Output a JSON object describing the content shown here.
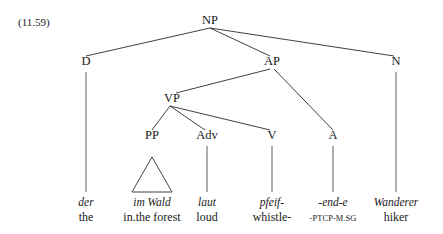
{
  "figure": {
    "example_number": "(11.59)",
    "language": "German",
    "type": "syntax-tree",
    "ink_color": "#1a1a1a",
    "line_color": "#2b2b2b",
    "background_color": "#ffffff"
  },
  "nodes": [
    {
      "id": "NP",
      "label": "NP",
      "x": 210,
      "y": 24,
      "level": 0
    },
    {
      "id": "D",
      "label": "D",
      "x": 86,
      "y": 65,
      "level": 1
    },
    {
      "id": "AP",
      "label": "AP",
      "x": 272,
      "y": 65,
      "level": 1
    },
    {
      "id": "N",
      "label": "N",
      "x": 396,
      "y": 65,
      "level": 1
    },
    {
      "id": "VP",
      "label": "VP",
      "x": 172,
      "y": 102,
      "level": 2
    },
    {
      "id": "PP",
      "label": "PP",
      "x": 152,
      "y": 139,
      "level": 3
    },
    {
      "id": "Adv",
      "label": "Adv",
      "x": 207,
      "y": 139,
      "level": 3
    },
    {
      "id": "V",
      "label": "V",
      "x": 272,
      "y": 139,
      "level": 3
    },
    {
      "id": "A",
      "label": "A",
      "x": 333,
      "y": 139,
      "level": 3
    }
  ],
  "edges": [
    {
      "from": "NP",
      "to": "D",
      "x1": 210,
      "y1": 28,
      "x2": 86,
      "y2": 56
    },
    {
      "from": "NP",
      "to": "AP",
      "x1": 210,
      "y1": 28,
      "x2": 270,
      "y2": 56
    },
    {
      "from": "NP",
      "to": "N",
      "x1": 210,
      "y1": 28,
      "x2": 394,
      "y2": 56
    },
    {
      "from": "AP",
      "to": "VP",
      "x1": 270,
      "y1": 69,
      "x2": 176,
      "y2": 93
    },
    {
      "from": "AP",
      "to": "A",
      "x1": 274,
      "y1": 69,
      "x2": 333,
      "y2": 130
    },
    {
      "from": "VP",
      "to": "PP",
      "x1": 170,
      "y1": 106,
      "x2": 152,
      "y2": 130
    },
    {
      "from": "VP",
      "to": "Adv",
      "x1": 170,
      "y1": 106,
      "x2": 205,
      "y2": 130
    },
    {
      "from": "VP",
      "to": "V",
      "x1": 170,
      "y1": 106,
      "x2": 270,
      "y2": 130
    }
  ],
  "stems": [
    {
      "node": "D",
      "x": 86,
      "y1": 72,
      "y2": 192
    },
    {
      "node": "Adv",
      "x": 207,
      "y1": 146,
      "y2": 192
    },
    {
      "node": "V",
      "x": 272,
      "y1": 146,
      "y2": 192
    },
    {
      "node": "A",
      "x": 333,
      "y1": 146,
      "y2": 192
    },
    {
      "node": "N",
      "x": 396,
      "y1": 72,
      "y2": 192
    }
  ],
  "triangle": {
    "node": "PP",
    "apex_x": 152,
    "apex_y": 157,
    "left_x": 132,
    "right_x": 172,
    "base_y": 192
  },
  "leaves": [
    {
      "id": "leaf-der",
      "x": 86,
      "form": "der",
      "gloss": "the",
      "gloss_style": "normal"
    },
    {
      "id": "leaf-im-wald",
      "x": 152,
      "form": "im Wald",
      "gloss": "in.the forest",
      "gloss_style": "normal"
    },
    {
      "id": "leaf-laut",
      "x": 207,
      "form": "laut",
      "gloss": "loud",
      "gloss_style": "normal"
    },
    {
      "id": "leaf-pfeif",
      "x": 272,
      "form": "pfeif-",
      "gloss": "whistle-",
      "gloss_style": "normal"
    },
    {
      "id": "leaf-end-e",
      "x": 333,
      "form": "-end-e",
      "gloss": "-PTCP-M.SG",
      "gloss_style": "smallcaps"
    },
    {
      "id": "leaf-wanderer",
      "x": 396,
      "form": "Wanderer",
      "gloss": "hiker",
      "gloss_style": "normal"
    }
  ],
  "leaf_rows": {
    "form_y": 206,
    "gloss_y": 221
  },
  "example_number_pos": {
    "x": 18,
    "y": 26
  }
}
